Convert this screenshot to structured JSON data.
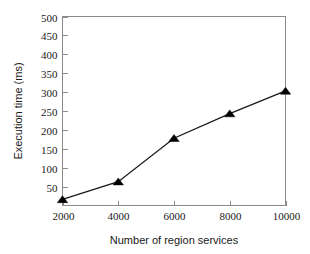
{
  "chart_data": {
    "type": "line",
    "title": "",
    "xlabel": "Number of region services",
    "ylabel": "Execution time (ms)",
    "x": [
      2000,
      4000,
      6000,
      8000,
      10000
    ],
    "values": [
      16,
      63,
      178,
      243,
      303
    ],
    "series": [
      {
        "name": "Execution time",
        "values": [
          16,
          63,
          178,
          243,
          303
        ],
        "marker": "filled-triangle",
        "color": "#000000"
      }
    ],
    "xlim": [
      2000,
      10000
    ],
    "ylim": [
      0,
      500
    ],
    "xticks": [
      2000,
      4000,
      6000,
      8000,
      10000
    ],
    "xtick_labels": [
      "2000",
      "4000",
      "6000",
      "8000",
      "10000"
    ],
    "yticks": [
      50,
      100,
      150,
      200,
      250,
      300,
      350,
      400,
      450,
      500
    ],
    "ytick_labels": [
      "50",
      "100",
      "150",
      "200",
      "250",
      "300",
      "350",
      "400",
      "450",
      "500"
    ],
    "grid": false,
    "legend": false,
    "legend_position": "none",
    "background_color": "#ffffff",
    "axis_color": "#8a8a8a",
    "line_color": "#000000"
  }
}
